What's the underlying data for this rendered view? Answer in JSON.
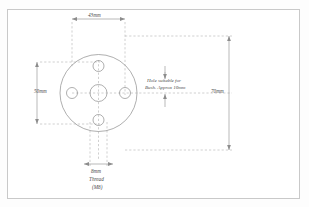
{
  "drawing": {
    "title": "Flange plate machining drawing",
    "line_color": "#8c8c8c",
    "dashed_color": "#a8a8a8",
    "text_color": "#4a4a4a",
    "border_color": "#c9c9c9",
    "background": "#ffffff"
  },
  "dimensions": {
    "top_width": "43mm",
    "left_height": "50mm",
    "right_height": "70mm",
    "bottom_width": "8mm"
  },
  "annotations": {
    "center_hole_line1": "Hole suitable for",
    "center_hole_line2": "Bush. Approx 10mm",
    "thread_line1": "8mm",
    "thread_line2": "Thread",
    "thread_line3": "(M8)"
  },
  "geometry": {
    "plate": {
      "cx": 98.5,
      "cy": 93,
      "r": 38.5
    },
    "center_hole": {
      "cx": 98.5,
      "cy": 93,
      "r": 8.5
    },
    "bolt_holes": [
      {
        "name": "top",
        "cx": 98.5,
        "cy": 66,
        "r": 5.5
      },
      {
        "name": "left",
        "cx": 72,
        "cy": 93,
        "r": 5.5
      },
      {
        "name": "right",
        "cx": 125,
        "cy": 93,
        "r": 5.5
      },
      {
        "name": "bottom",
        "cx": 98.5,
        "cy": 120,
        "r": 5.5
      }
    ]
  }
}
